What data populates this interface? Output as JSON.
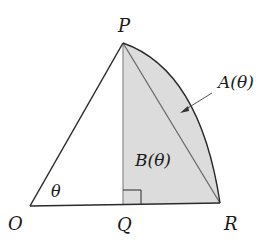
{
  "diagram": {
    "type": "geometry",
    "colors": {
      "stroke": "#2a2a2a",
      "shade": "#dcdcdc",
      "inner_stroke": "#6a6a6a",
      "background": "#ffffff"
    },
    "points": {
      "O": {
        "label": "O",
        "x": 30,
        "y": 206
      },
      "P": {
        "label": "P",
        "x": 123,
        "y": 43
      },
      "Q": {
        "label": "Q",
        "x": 123,
        "y": 205
      },
      "R": {
        "label": "R",
        "x": 220,
        "y": 203
      }
    },
    "labels": {
      "P": "P",
      "O": "O",
      "Q": "Q",
      "R": "R",
      "angle": "θ",
      "region_a": "A(θ)",
      "region_b": "B(θ)"
    },
    "regions": [
      {
        "name": "A(θ)",
        "description": "circular segment between chord PR and arc PR"
      },
      {
        "name": "B(θ)",
        "description": "triangle PQR"
      }
    ]
  }
}
